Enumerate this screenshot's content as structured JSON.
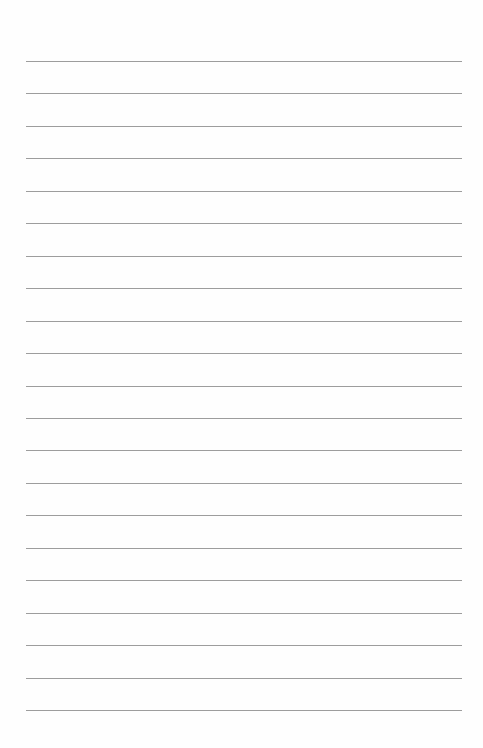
{
  "page": {
    "type": "lined-paper",
    "line_count": 21,
    "first_line_y": 61,
    "line_spacing": 32.45,
    "line_left": 26,
    "line_right": 462,
    "line_color": "#8c8c8c",
    "background_color": "#fefefe"
  }
}
